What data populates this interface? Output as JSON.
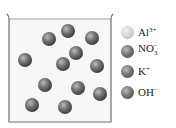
{
  "diagram": {
    "beaker": {
      "left": 8,
      "right": 112,
      "top": 14,
      "surface_y": 19,
      "bottom": 122,
      "wall_color": "#777777",
      "liquid_color": "#f6f6f6"
    },
    "particles": [
      {
        "x": 49,
        "y": 39,
        "r": 7
      },
      {
        "x": 68,
        "y": 31,
        "r": 7
      },
      {
        "x": 92,
        "y": 38,
        "r": 7
      },
      {
        "x": 25,
        "y": 60,
        "r": 7
      },
      {
        "x": 76,
        "y": 53,
        "r": 7
      },
      {
        "x": 63,
        "y": 64,
        "r": 7
      },
      {
        "x": 97,
        "y": 66,
        "r": 7
      },
      {
        "x": 45,
        "y": 85,
        "r": 7
      },
      {
        "x": 78,
        "y": 88,
        "r": 7
      },
      {
        "x": 100,
        "y": 94,
        "r": 7
      },
      {
        "x": 32,
        "y": 105,
        "r": 7
      },
      {
        "x": 65,
        "y": 107,
        "r": 7
      }
    ],
    "particle_color": "#6e6e6e",
    "legend": [
      {
        "ion": "Al",
        "sup": "3+",
        "sub": "",
        "color": "#c8c8c8",
        "top": 32
      },
      {
        "ion": "NO",
        "sup": "",
        "sub": "3",
        "sub_sup": "−",
        "color": "#5e5e5e",
        "top": 51
      },
      {
        "ion": "K",
        "sup": "+",
        "sub": "",
        "color": "#6a6a6a",
        "top": 71
      },
      {
        "ion": "OH",
        "sup": "−",
        "sub": "",
        "color": "#7a7a7a",
        "top": 92
      }
    ]
  }
}
